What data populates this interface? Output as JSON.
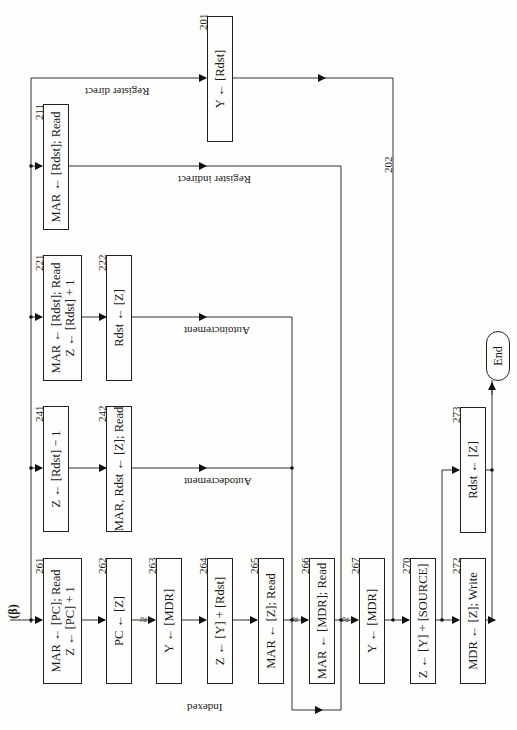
{
  "diagram": {
    "entry_label": "(β)",
    "orientation": "rotated 90° counter-clockwise (page printed sideways)",
    "boxes": [
      {
        "id": "201",
        "text": [
          "Y ← [Rdst]"
        ]
      },
      {
        "id": "211",
        "text": [
          "MAR ← [Rdst]; Read"
        ]
      },
      {
        "id": "221",
        "text": [
          "MAR ← [Rdst]; Read",
          "Z ← [Rdst] + 1"
        ]
      },
      {
        "id": "222",
        "text": [
          "Rdst ← [Z]"
        ]
      },
      {
        "id": "241",
        "text": [
          "Z ← [Rdst] − 1"
        ]
      },
      {
        "id": "242",
        "text": [
          "MAR, Rdst ← [Z]; Read"
        ]
      },
      {
        "id": "261",
        "text": [
          "MAR ← [PC]; Read",
          "Z ← [PC] + 1"
        ]
      },
      {
        "id": "262",
        "text": [
          "PC ← [Z]"
        ]
      },
      {
        "id": "263",
        "text": [
          "Y ← [MDR]"
        ]
      },
      {
        "id": "264",
        "text": [
          "Z ← [Y] + [Rdst]"
        ]
      },
      {
        "id": "265",
        "text": [
          "MAR ← [Z]; Read"
        ]
      },
      {
        "id": "266",
        "text": [
          "MAR ← [MDR]; Read"
        ]
      },
      {
        "id": "267",
        "text": [
          "Y ← [MDR]"
        ]
      },
      {
        "id": "270",
        "text": [
          "Z ← [Y] + [SOURCE]"
        ]
      },
      {
        "id": "272",
        "text": [
          "MDR ← [Z]; Write"
        ]
      },
      {
        "id": "273",
        "text": [
          "Rdst ← [Z]"
        ]
      }
    ],
    "terminal": {
      "text": "End"
    },
    "path_labels": {
      "register_direct": "Register direct",
      "register_indirect": "Register indirect",
      "autoincrement": "Autoincrement",
      "autodecrement": "Autodecrement",
      "indexed": "Indexed"
    },
    "line_labels": {
      "line_202": "202"
    },
    "wait_symbol": "≈"
  }
}
